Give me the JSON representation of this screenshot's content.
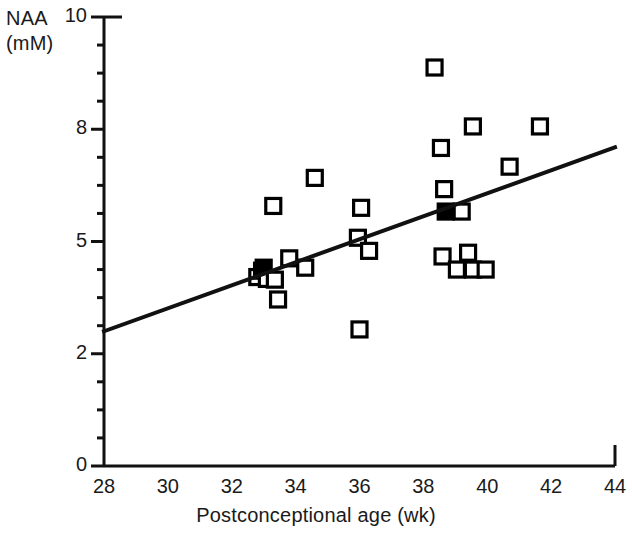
{
  "chart_data": {
    "type": "scatter",
    "title": "",
    "xlabel": "Postconceptional age (wk)",
    "ylabel": "NAA\n(mM)",
    "ylabel_lines": [
      "NAA",
      "(mM)"
    ],
    "xlim": [
      28,
      44
    ],
    "ylim": [
      0,
      10
    ],
    "xticks": [
      28,
      30,
      32,
      34,
      36,
      38,
      40,
      42,
      44
    ],
    "xticklabels": [
      "28",
      "30",
      "32",
      "34",
      "36",
      "38",
      "40",
      "42",
      "44"
    ],
    "yticks": [
      0,
      2,
      5,
      8,
      10
    ],
    "yticklabels": [
      "0",
      "2",
      "5",
      "8",
      "10"
    ],
    "ytick_note": "Axis labels 0, 2, 5, 8, 10 are drawn at evenly spaced positions",
    "y_minor_ticks_per_interval": 3,
    "grid": false,
    "legend": null,
    "marker": "open-square",
    "marker_color": "#000000",
    "points": [
      {
        "x": 32.8,
        "y": 4.05
      },
      {
        "x": 32.95,
        "y": 4.22
      },
      {
        "x": 33.0,
        "y": 4.3,
        "filled": true
      },
      {
        "x": 33.1,
        "y": 4.0
      },
      {
        "x": 33.35,
        "y": 3.98
      },
      {
        "x": 33.3,
        "y": 5.95
      },
      {
        "x": 33.45,
        "y": 3.45
      },
      {
        "x": 33.8,
        "y": 4.55
      },
      {
        "x": 34.3,
        "y": 4.3
      },
      {
        "x": 34.6,
        "y": 6.7
      },
      {
        "x": 35.95,
        "y": 5.1
      },
      {
        "x": 36.05,
        "y": 5.9
      },
      {
        "x": 36.3,
        "y": 4.75
      },
      {
        "x": 36.0,
        "y": 2.65
      },
      {
        "x": 38.35,
        "y": 9.1
      },
      {
        "x": 38.55,
        "y": 7.5
      },
      {
        "x": 38.65,
        "y": 6.4
      },
      {
        "x": 38.7,
        "y": 5.8,
        "filled": true
      },
      {
        "x": 38.6,
        "y": 4.6
      },
      {
        "x": 39.2,
        "y": 5.8
      },
      {
        "x": 39.05,
        "y": 4.25
      },
      {
        "x": 39.4,
        "y": 4.7
      },
      {
        "x": 39.55,
        "y": 4.25
      },
      {
        "x": 39.95,
        "y": 4.25
      },
      {
        "x": 39.55,
        "y": 8.05
      },
      {
        "x": 40.7,
        "y": 7.0
      },
      {
        "x": 41.65,
        "y": 8.05
      }
    ],
    "trendline": {
      "label": "regression line",
      "x0": 28,
      "y0": 2.6,
      "x1": 44,
      "y1": 7.52
    }
  }
}
